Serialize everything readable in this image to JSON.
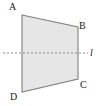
{
  "figure": {
    "type": "geometry-diagram",
    "canvas": {
      "width": 100,
      "height": 106,
      "background": "#ffffff"
    },
    "shape": {
      "name": "quadrilateral-ABCD",
      "fill": "#e6e6e6",
      "stroke": "#808080",
      "stroke_width": 1.1,
      "vertices": [
        {
          "label": "A",
          "x": 22,
          "y": 15
        },
        {
          "label": "B",
          "x": 78,
          "y": 27
        },
        {
          "label": "C",
          "x": 78,
          "y": 79
        },
        {
          "label": "D",
          "x": 22,
          "y": 92
        }
      ]
    },
    "dashed_line": {
      "label": "l",
      "stroke": "#8a8a8a",
      "stroke_width": 1,
      "dash_pattern": "2 2",
      "x1": 3,
      "y1": 53,
      "x2": 88,
      "y2": 53
    },
    "labels": {
      "a": "A",
      "b": "B",
      "c": "C",
      "d": "D",
      "line": "l"
    }
  }
}
